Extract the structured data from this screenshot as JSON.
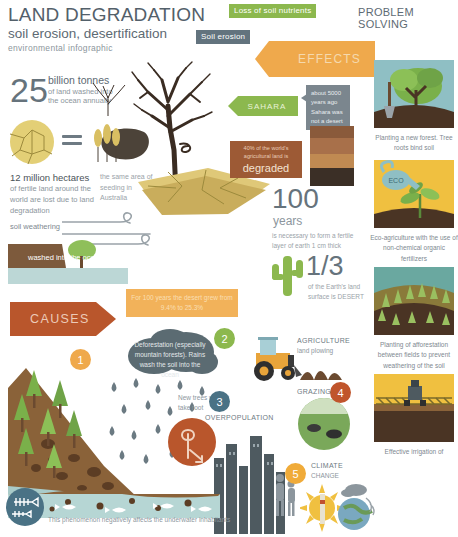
{
  "header": {
    "title": "LAND DEGRADATION",
    "subtitle": "soil erosion, desertification",
    "tagline": "environmental infographic",
    "tag_nutrients": "Loss of soil nutrients",
    "tag_erosion": "Soil erosion",
    "effects_label": "EFFECTS",
    "problem_solving": "PROBLEM SOLVING"
  },
  "stats": {
    "tonnes_value": "25",
    "tonnes_line1": "billion tonnes",
    "tonnes_line2": "of land washed into",
    "tonnes_line3": "the ocean annually",
    "hectares_head": "12 million hectares",
    "hectares_body": "of fertile land around the world are lost due to land degradation",
    "australia_caption": "the same area of seeding in Australia",
    "weathering_label": "soil weathering",
    "washed_label": "washed into the ocean",
    "years_value": "100",
    "years_word": "years",
    "years_caption": "is necessary to form a fertile layer of earth 1 cm thick",
    "third_value": "1/3",
    "third_caption": "of the Earth's land surface is DESERT"
  },
  "center": {
    "sahara_label": "SAHARA",
    "bubble_5000": "about 5000 years ago Sahara was not a desert",
    "degraded_small": "40% of the world's agricultural land is",
    "degraded_big": "degraded"
  },
  "causes": {
    "heading": "CAUSES",
    "desert_banner": "For 100 years the desert grew from 9.4% to 25.3%",
    "items": [
      {
        "number": "1",
        "text": "Deforestation (especially mountain forests). Rains wash the soil into the ocean"
      },
      {
        "number": "2",
        "label": "AGRICULTURE",
        "sublabel": "land plowing"
      },
      {
        "number": "3",
        "label": "OVERPOPULATION"
      },
      {
        "number": "4",
        "label": "GRAZING"
      },
      {
        "number": "5",
        "label": "CLIMATE",
        "sublabel": "CHANGE"
      }
    ],
    "new_trees": "New trees will not take root",
    "underwater_caption": "This phenomenon negatively affects the underwater inhabitants"
  },
  "solutions": [
    {
      "caption": "Planting a new forest. Tree roots bind soil"
    },
    {
      "caption": "Eco-agriculture with the use of non-chemical organic fertilizers",
      "can_label": "ECO"
    },
    {
      "caption": "Planting of afforestation between fields to prevent weathering of the soil"
    },
    {
      "caption": "Effective irrigation of"
    }
  ],
  "colors": {
    "green": "#8cb84e",
    "orange": "#efa94c",
    "slate": "#63737e",
    "rust": "#b9562c",
    "brown": "#9d5a35",
    "yellow": "#f2b25a",
    "blue": "#4a7285"
  }
}
